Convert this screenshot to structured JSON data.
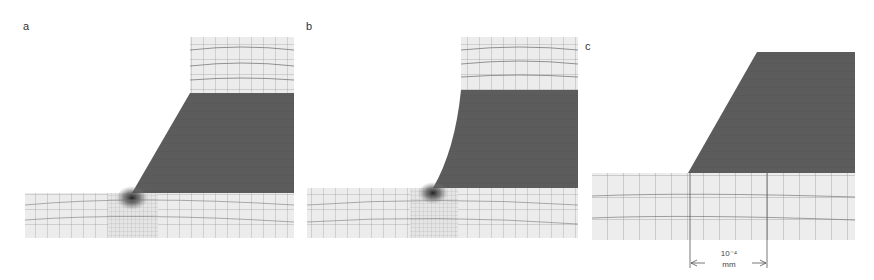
{
  "figure": {
    "panels": [
      {
        "id": "a",
        "label": "a",
        "description": "Finite element mesh: straight-edged tapered film on substrate, fine mesh concentrated at corner"
      },
      {
        "id": "b",
        "label": "b",
        "description": "Finite element mesh: curved (concave) edge film on substrate, fine mesh at corner"
      },
      {
        "id": "c",
        "label": "c",
        "description": "Close-up of tapered film edge on substrate mesh with scale bar"
      }
    ],
    "scale_bar": {
      "value": "10⁻⁴",
      "unit": "mm"
    },
    "colors": {
      "film": "#5a5a5a",
      "substrate": "#ececec",
      "mesh_line": "#7a7a7a",
      "background": "#ffffff"
    }
  }
}
